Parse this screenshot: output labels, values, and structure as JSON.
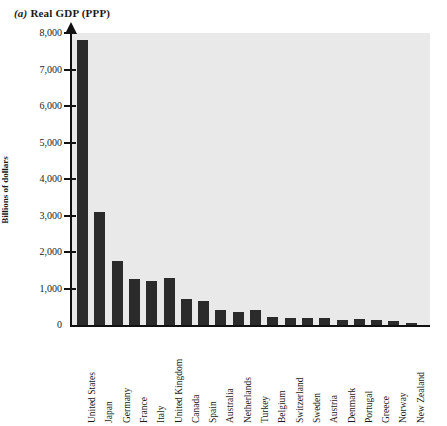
{
  "figure": {
    "panel_label": "(a)",
    "title_text": "Real GDP (PPP)"
  },
  "chart_data": {
    "type": "bar",
    "title": "(a) Real GDP (PPP)",
    "xlabel": "",
    "ylabel": "Billions of dollars",
    "ylim": [
      0,
      8000
    ],
    "ytick_labels": [
      "8,000",
      "7,000",
      "6,000",
      "5,000",
      "4,000",
      "3,000",
      "2,000",
      "1,000",
      "0"
    ],
    "ytick_values": [
      8000,
      7000,
      6000,
      5000,
      4000,
      3000,
      2000,
      1000,
      0
    ],
    "grid": false,
    "legend": false,
    "bar_color": "#2b2b2b",
    "plot_background": "#e9e9e9",
    "categories": [
      "United States",
      "Japan",
      "Germany",
      "France",
      "Italy",
      "United Kingdom",
      "Canada",
      "Spain",
      "Australia",
      "Netherlands",
      "Turkey",
      "Belgium",
      "Switzerland",
      "Sweden",
      "Austria",
      "Denmark",
      "Portugal",
      "Greece",
      "Norway",
      "New Zealand"
    ],
    "values": [
      7800,
      3100,
      1750,
      1250,
      1200,
      1300,
      700,
      650,
      420,
      350,
      400,
      230,
      200,
      190,
      180,
      130,
      160,
      140,
      115,
      65
    ]
  }
}
